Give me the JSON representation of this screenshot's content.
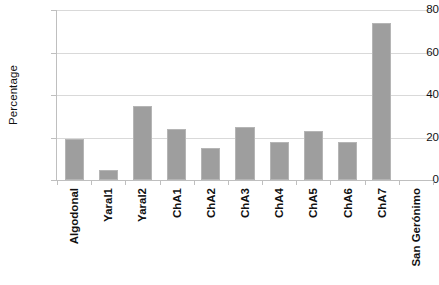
{
  "chart_data": {
    "type": "bar",
    "title": "",
    "xlabel": "",
    "ylabel": "Percentage",
    "categories": [
      "Algodonal",
      "Yaral1",
      "Yaral2",
      "ChA1",
      "ChA2",
      "ChA3",
      "ChA4",
      "ChA5",
      "ChA6",
      "ChA7",
      "San Gerónimo"
    ],
    "values": [
      19.5,
      4.5,
      35,
      24,
      15,
      25,
      18,
      23,
      18,
      74,
      0
    ],
    "ylim": [
      0,
      80
    ],
    "yticks": [
      0,
      20,
      40,
      60,
      80
    ],
    "ytick_labels": [
      "0",
      "20",
      "40",
      "60",
      "80"
    ],
    "grid": "horizontal",
    "legend": "none",
    "series": [
      {
        "name": "Percentage",
        "values": [
          19.5,
          4.5,
          35,
          24,
          15,
          25,
          18,
          23,
          18,
          74,
          0
        ]
      }
    ]
  },
  "colors": {
    "bar_fill": "#9e9e9e",
    "bar_border": "#b5b5b5",
    "gridline": "#d9d9d9",
    "axis": "#bfbfbf",
    "text": "#111111",
    "background": "#ffffff"
  }
}
